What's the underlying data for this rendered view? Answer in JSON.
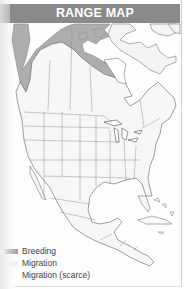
{
  "header": {
    "title": "RANGE MAP"
  },
  "legend": [
    {
      "label": "Breeding",
      "color": "#9a9a9a"
    },
    {
      "label": "Migration",
      "color": "#eeeeee"
    },
    {
      "label": "Migration (scarce)",
      "color": "#ffffff"
    }
  ],
  "colors": {
    "header_bg": "#8a8a8a",
    "breeding": "#a9a9a9",
    "land": "#f7f7f7",
    "border": "#777777"
  }
}
